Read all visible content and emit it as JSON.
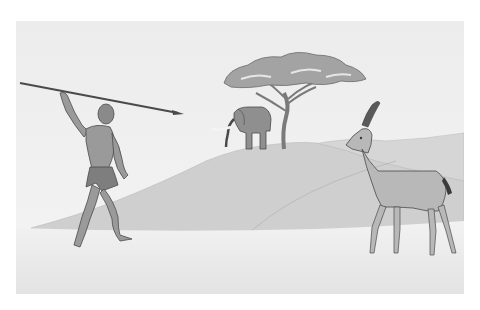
{
  "scene": {
    "description": "Savanna hunting illustration",
    "subjects": [
      "hunter",
      "spear",
      "elephant",
      "acacia-tree",
      "antelope",
      "hills",
      "ground"
    ]
  },
  "colors": {
    "background": "#ffffff",
    "sky": "#efefef",
    "ground": "#ebebeb",
    "hill_far": "#d4d4d4",
    "hill_mid": "#cfcfcf",
    "hill_near": "#d9d9d9",
    "figure_fill": "#9a9a9a",
    "figure_dark": "#6e6e6e",
    "outline": "#4a4a4a",
    "tree_canopy": "#a3a3a3",
    "antelope_fill": "#b8b8b8",
    "horn": "#5a5a5a"
  }
}
